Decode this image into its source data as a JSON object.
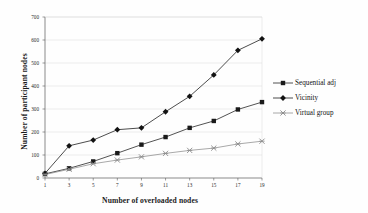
{
  "chart_data": {
    "type": "line",
    "title": "",
    "xlabel": "Number of overloaded nodes",
    "ylabel": "Number of participant nodes",
    "x": [
      1,
      3,
      5,
      7,
      9,
      11,
      13,
      15,
      17,
      19
    ],
    "xtick_labels": [
      "1",
      "3",
      "5",
      "7",
      "9",
      "11",
      "13",
      "15",
      "17",
      "19"
    ],
    "ytick_labels": [
      "0",
      "100",
      "200",
      "300",
      "400",
      "500",
      "600",
      "700"
    ],
    "yticks": [
      0,
      100,
      200,
      300,
      400,
      500,
      600,
      700
    ],
    "ylim": [
      0,
      700
    ],
    "xlim": [
      1,
      19
    ],
    "grid": true,
    "grid_axis": "y",
    "legend_position": "right",
    "series": [
      {
        "name": "Sequential adj",
        "marker": "square",
        "color": "#1a1a1a",
        "values": [
          18,
          42,
          72,
          108,
          145,
          178,
          218,
          248,
          298,
          330
        ]
      },
      {
        "name": "Vicinity",
        "marker": "diamond",
        "color": "#121212",
        "values": [
          20,
          140,
          165,
          210,
          218,
          288,
          355,
          448,
          555,
          605
        ]
      },
      {
        "name": "Virtual group",
        "marker": "cross",
        "color": "#8c8c8c",
        "values": [
          15,
          38,
          62,
          78,
          92,
          107,
          120,
          130,
          148,
          160
        ]
      }
    ]
  },
  "legend": {
    "items": [
      {
        "label": "Sequential adj",
        "marker": "square"
      },
      {
        "label": "Vicinity",
        "marker": "diamond"
      },
      {
        "label": "Virtual group",
        "marker": "cross"
      }
    ]
  },
  "colors": {
    "background": "#ffffff",
    "axis": "#5a5a5a",
    "grid": "#d9d9d9",
    "series_dark": "#151515",
    "series_gray": "#8c8c8c"
  }
}
